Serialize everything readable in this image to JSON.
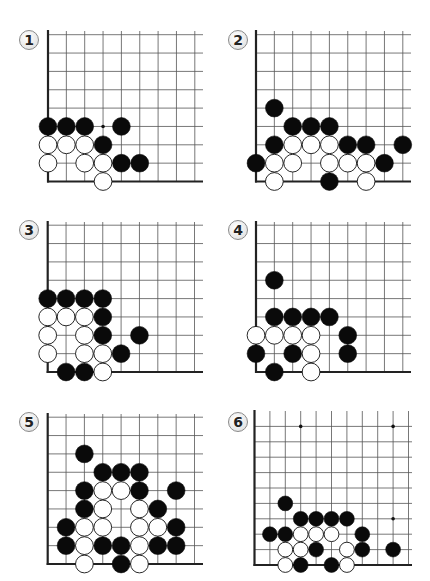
{
  "colors": {
    "grid_line": "#555555",
    "edge_line": "#222222",
    "black_stone": "#0a0a0a",
    "white_stone_fill": "#ffffff",
    "white_stone_stroke": "#111111",
    "star_point": "#111111"
  },
  "problems": [
    {
      "number": "1",
      "badge": {
        "x": 19,
        "y": 30
      },
      "grid": {
        "left": 48,
        "bottom": 181.5,
        "spacing": 18.35,
        "cols": 9,
        "rows": 9,
        "right_extent": 203,
        "top_extent": 31
      },
      "stones": [
        {
          "c": 0,
          "r": 3,
          "color": "black"
        },
        {
          "c": 1,
          "r": 3,
          "color": "black"
        },
        {
          "c": 2,
          "r": 3,
          "color": "black"
        },
        {
          "c": 4,
          "r": 3,
          "color": "black"
        },
        {
          "c": 0,
          "r": 2,
          "color": "white"
        },
        {
          "c": 1,
          "r": 2,
          "color": "white"
        },
        {
          "c": 2,
          "r": 2,
          "color": "white"
        },
        {
          "c": 3,
          "r": 2,
          "color": "black"
        },
        {
          "c": 0,
          "r": 1,
          "color": "white"
        },
        {
          "c": 2,
          "r": 1,
          "color": "white"
        },
        {
          "c": 3,
          "r": 1,
          "color": "white"
        },
        {
          "c": 4,
          "r": 1,
          "color": "black"
        },
        {
          "c": 5,
          "r": 1,
          "color": "black"
        },
        {
          "c": 3,
          "r": 0,
          "color": "white"
        }
      ],
      "markers": [
        {
          "c": 3,
          "r": 3,
          "type": "dot"
        }
      ]
    },
    {
      "number": "2",
      "badge": {
        "x": 228,
        "y": 30
      },
      "grid": {
        "left": 256,
        "bottom": 181.5,
        "spacing": 18.35,
        "cols": 9,
        "rows": 9,
        "right_extent": 411,
        "top_extent": 31
      },
      "stones": [
        {
          "c": 1,
          "r": 4,
          "color": "black"
        },
        {
          "c": 2,
          "r": 3,
          "color": "black"
        },
        {
          "c": 3,
          "r": 3,
          "color": "black"
        },
        {
          "c": 4,
          "r": 3,
          "color": "black"
        },
        {
          "c": 1,
          "r": 2,
          "color": "black"
        },
        {
          "c": 2,
          "r": 2,
          "color": "white"
        },
        {
          "c": 3,
          "r": 2,
          "color": "white"
        },
        {
          "c": 4,
          "r": 2,
          "color": "white"
        },
        {
          "c": 5,
          "r": 2,
          "color": "black"
        },
        {
          "c": 6,
          "r": 2,
          "color": "black"
        },
        {
          "c": 8,
          "r": 2,
          "color": "black"
        },
        {
          "c": 0,
          "r": 1,
          "color": "black"
        },
        {
          "c": 1,
          "r": 1,
          "color": "white"
        },
        {
          "c": 2,
          "r": 1,
          "color": "white"
        },
        {
          "c": 4,
          "r": 1,
          "color": "white"
        },
        {
          "c": 5,
          "r": 1,
          "color": "white"
        },
        {
          "c": 6,
          "r": 1,
          "color": "white"
        },
        {
          "c": 7,
          "r": 1,
          "color": "black"
        },
        {
          "c": 1,
          "r": 0,
          "color": "white"
        },
        {
          "c": 4,
          "r": 0,
          "color": "black"
        },
        {
          "c": 6,
          "r": 0,
          "color": "white"
        }
      ],
      "markers": []
    },
    {
      "number": "3",
      "badge": {
        "x": 19,
        "y": 220
      },
      "grid": {
        "left": 47.7,
        "bottom": 372,
        "spacing": 18.35,
        "cols": 9,
        "rows": 9,
        "right_extent": 203,
        "top_extent": 222
      },
      "stones": [
        {
          "c": 0,
          "r": 4,
          "color": "black"
        },
        {
          "c": 1,
          "r": 4,
          "color": "black"
        },
        {
          "c": 2,
          "r": 4,
          "color": "black"
        },
        {
          "c": 3,
          "r": 4,
          "color": "black"
        },
        {
          "c": 0,
          "r": 3,
          "color": "white"
        },
        {
          "c": 1,
          "r": 3,
          "color": "white"
        },
        {
          "c": 2,
          "r": 3,
          "color": "white"
        },
        {
          "c": 3,
          "r": 3,
          "color": "black"
        },
        {
          "c": 0,
          "r": 2,
          "color": "white"
        },
        {
          "c": 2,
          "r": 2,
          "color": "white"
        },
        {
          "c": 3,
          "r": 2,
          "color": "black"
        },
        {
          "c": 5,
          "r": 2,
          "color": "black"
        },
        {
          "c": 0,
          "r": 1,
          "color": "white"
        },
        {
          "c": 2,
          "r": 1,
          "color": "white"
        },
        {
          "c": 3,
          "r": 1,
          "color": "white"
        },
        {
          "c": 4,
          "r": 1,
          "color": "black"
        },
        {
          "c": 1,
          "r": 0,
          "color": "black"
        },
        {
          "c": 2,
          "r": 0,
          "color": "black"
        },
        {
          "c": 3,
          "r": 0,
          "color": "white"
        }
      ],
      "markers": []
    },
    {
      "number": "4",
      "badge": {
        "x": 228,
        "y": 220
      },
      "grid": {
        "left": 256,
        "bottom": 372,
        "spacing": 18.35,
        "cols": 9,
        "rows": 9,
        "right_extent": 411,
        "top_extent": 222
      },
      "stones": [
        {
          "c": 1,
          "r": 5,
          "color": "black"
        },
        {
          "c": 1,
          "r": 3,
          "color": "black"
        },
        {
          "c": 2,
          "r": 3,
          "color": "black"
        },
        {
          "c": 3,
          "r": 3,
          "color": "black"
        },
        {
          "c": 4,
          "r": 3,
          "color": "black"
        },
        {
          "c": 0,
          "r": 2,
          "color": "white"
        },
        {
          "c": 1,
          "r": 2,
          "color": "white"
        },
        {
          "c": 2,
          "r": 2,
          "color": "white"
        },
        {
          "c": 3,
          "r": 2,
          "color": "white"
        },
        {
          "c": 5,
          "r": 2,
          "color": "black"
        },
        {
          "c": 0,
          "r": 1,
          "color": "black"
        },
        {
          "c": 2,
          "r": 1,
          "color": "black"
        },
        {
          "c": 3,
          "r": 1,
          "color": "white"
        },
        {
          "c": 5,
          "r": 1,
          "color": "black"
        },
        {
          "c": 1,
          "r": 0,
          "color": "black"
        },
        {
          "c": 3,
          "r": 0,
          "color": "white"
        }
      ],
      "markers": []
    },
    {
      "number": "5",
      "badge": {
        "x": 19,
        "y": 412
      },
      "grid": {
        "left": 47.7,
        "bottom": 564,
        "spacing": 18.35,
        "cols": 9,
        "rows": 9,
        "right_extent": 203,
        "top_extent": 414
      },
      "stones": [
        {
          "c": 2,
          "r": 6,
          "color": "black"
        },
        {
          "c": 3,
          "r": 5,
          "color": "black"
        },
        {
          "c": 4,
          "r": 5,
          "color": "black"
        },
        {
          "c": 5,
          "r": 5,
          "color": "black"
        },
        {
          "c": 2,
          "r": 4,
          "color": "black"
        },
        {
          "c": 3,
          "r": 4,
          "color": "white"
        },
        {
          "c": 4,
          "r": 4,
          "color": "white"
        },
        {
          "c": 5,
          "r": 4,
          "color": "black"
        },
        {
          "c": 7,
          "r": 4,
          "color": "black"
        },
        {
          "c": 2,
          "r": 3,
          "color": "black"
        },
        {
          "c": 3,
          "r": 3,
          "color": "white"
        },
        {
          "c": 5,
          "r": 3,
          "color": "white"
        },
        {
          "c": 6,
          "r": 3,
          "color": "black"
        },
        {
          "c": 1,
          "r": 2,
          "color": "black"
        },
        {
          "c": 2,
          "r": 2,
          "color": "white"
        },
        {
          "c": 3,
          "r": 2,
          "color": "white"
        },
        {
          "c": 5,
          "r": 2,
          "color": "white"
        },
        {
          "c": 6,
          "r": 2,
          "color": "white"
        },
        {
          "c": 7,
          "r": 2,
          "color": "black"
        },
        {
          "c": 1,
          "r": 1,
          "color": "black"
        },
        {
          "c": 2,
          "r": 1,
          "color": "white"
        },
        {
          "c": 3,
          "r": 1,
          "color": "black"
        },
        {
          "c": 4,
          "r": 1,
          "color": "black"
        },
        {
          "c": 5,
          "r": 1,
          "color": "white"
        },
        {
          "c": 6,
          "r": 1,
          "color": "black"
        },
        {
          "c": 7,
          "r": 1,
          "color": "black"
        },
        {
          "c": 2,
          "r": 0,
          "color": "white"
        },
        {
          "c": 4,
          "r": 0,
          "color": "black"
        },
        {
          "c": 5,
          "r": 0,
          "color": "white"
        }
      ],
      "markers": []
    },
    {
      "number": "6",
      "badge": {
        "x": 228,
        "y": 412
      },
      "grid": {
        "left": 254.5,
        "bottom": 565,
        "spacing": 15.4,
        "cols": 11,
        "rows": 10,
        "right_extent": 412,
        "top_extent": 411
      },
      "stones": [
        {
          "c": 2,
          "r": 4,
          "color": "black"
        },
        {
          "c": 3,
          "r": 3,
          "color": "black"
        },
        {
          "c": 4,
          "r": 3,
          "color": "black"
        },
        {
          "c": 5,
          "r": 3,
          "color": "black"
        },
        {
          "c": 6,
          "r": 3,
          "color": "black"
        },
        {
          "c": 1,
          "r": 2,
          "color": "black"
        },
        {
          "c": 2,
          "r": 2,
          "color": "black"
        },
        {
          "c": 3,
          "r": 2,
          "color": "white"
        },
        {
          "c": 4,
          "r": 2,
          "color": "white"
        },
        {
          "c": 5,
          "r": 2,
          "color": "white"
        },
        {
          "c": 7,
          "r": 2,
          "color": "black"
        },
        {
          "c": 2,
          "r": 1,
          "color": "white"
        },
        {
          "c": 3,
          "r": 1,
          "color": "white"
        },
        {
          "c": 4,
          "r": 1,
          "color": "black"
        },
        {
          "c": 6,
          "r": 1,
          "color": "white"
        },
        {
          "c": 7,
          "r": 1,
          "color": "black"
        },
        {
          "c": 9,
          "r": 1,
          "color": "black"
        },
        {
          "c": 2,
          "r": 0,
          "color": "white"
        },
        {
          "c": 3,
          "r": 0,
          "color": "black"
        },
        {
          "c": 5,
          "r": 0,
          "color": "black"
        },
        {
          "c": 6,
          "r": 0,
          "color": "white"
        }
      ],
      "markers": [
        {
          "c": 3,
          "r": 9,
          "type": "star"
        },
        {
          "c": 9,
          "r": 9,
          "type": "star"
        },
        {
          "c": 9,
          "r": 3,
          "type": "star"
        }
      ]
    }
  ]
}
